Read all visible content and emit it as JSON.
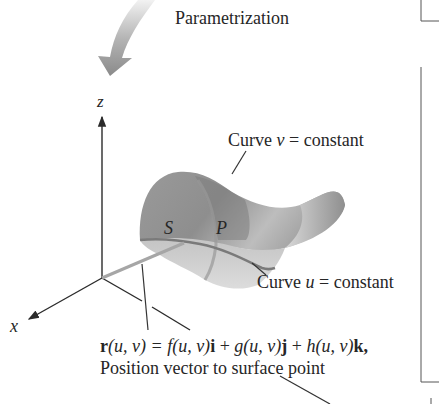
{
  "diagram": {
    "parametrization_label": "Parametrization",
    "axes": {
      "x": "x",
      "z": "z"
    },
    "surface_label": "S",
    "point_label": "P",
    "curve_v": {
      "prefix": "Curve ",
      "var": "v",
      "suffix": " = constant"
    },
    "curve_u": {
      "prefix": "Curve ",
      "var": "u",
      "suffix": " = constant"
    },
    "equation": {
      "r": "r",
      "args1": "(u, v) = ",
      "f": "f",
      "args2": "(u, v)",
      "i": "i",
      "plus1": " + ",
      "g": "g",
      "args3": "(u, v)",
      "j": "j",
      "plus2": " + ",
      "h": "h",
      "args4": "(u, v)",
      "k": "k",
      "comma": ","
    },
    "position_caption": "Position vector to surface point",
    "colors": {
      "surface_dark": "#8a8a8a",
      "surface_mid": "#a8a8a8",
      "surface_light": "#d2d2d2",
      "axis": "#2b2b2b",
      "arrow_grad_start": "#e6e6e6",
      "arrow_grad_end": "#8c8c8c"
    }
  }
}
